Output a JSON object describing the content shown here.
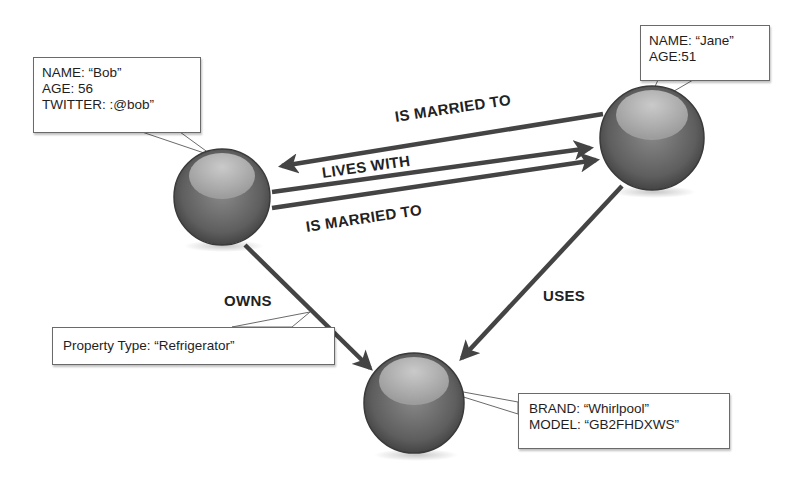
{
  "diagram": {
    "type": "property-graph",
    "nodes": [
      {
        "id": "bob",
        "properties": [
          "NAME: “Bob”",
          "AGE: 56",
          "TWITTER: :@bob”"
        ]
      },
      {
        "id": "jane",
        "properties": [
          "NAME: “Jane”",
          "AGE:51"
        ]
      },
      {
        "id": "refrigerator",
        "properties": [
          "BRAND: “Whirlpool”",
          "MODEL: “GB2FHDXWS”"
        ]
      }
    ],
    "edges": [
      {
        "from": "jane",
        "to": "bob",
        "label": "IS MARRIED TO"
      },
      {
        "from": "bob",
        "to": "jane",
        "label": "LIVES WITH"
      },
      {
        "from": "bob",
        "to": "jane",
        "label": "IS MARRIED TO"
      },
      {
        "from": "bob",
        "to": "refrigerator",
        "label": "OWNS",
        "properties": [
          "Property Type: “Refrigerator”"
        ]
      },
      {
        "from": "jane",
        "to": "refrigerator",
        "label": "USES"
      }
    ]
  },
  "labels": {
    "married_top": "IS MARRIED TO",
    "lives_with": "LIVES WITH",
    "married_bottom": "IS MARRIED TO",
    "owns": "OWNS",
    "uses": "USES"
  },
  "callouts": {
    "bob": {
      "name": "NAME: “Bob”",
      "age": "AGE: 56",
      "twitter": "TWITTER: :@bob”"
    },
    "jane": {
      "name": "NAME: “Jane”",
      "age": "AGE:51"
    },
    "owns_property": {
      "type": "Property Type: “Refrigerator”"
    },
    "fridge": {
      "brand": "BRAND: “Whirlpool”",
      "model": "MODEL: “GB2FHDXWS”"
    }
  },
  "colors": {
    "node_dark": "#4a4a4a",
    "node_mid": "#7a7a7a",
    "node_highlight": "#bdbdbd",
    "edge": "#444444",
    "text": "#1e1e1e"
  }
}
